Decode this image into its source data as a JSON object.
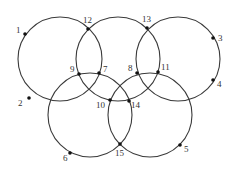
{
  "diagram": {
    "type": "five-interlocking-circles",
    "circles": [
      {
        "id": "top-left",
        "cx": 60,
        "cy": 59,
        "r": 42
      },
      {
        "id": "top-middle",
        "cx": 118,
        "cy": 59,
        "r": 42
      },
      {
        "id": "top-right",
        "cx": 178,
        "cy": 59,
        "r": 42
      },
      {
        "id": "bottom-left",
        "cx": 90,
        "cy": 115,
        "r": 42
      },
      {
        "id": "bottom-right",
        "cx": 150,
        "cy": 115,
        "r": 42
      }
    ],
    "nodes": [
      {
        "label": "1",
        "x": 25,
        "y": 34,
        "lx": 16,
        "ly": 33
      },
      {
        "label": "2",
        "x": 29,
        "y": 98,
        "lx": 18,
        "ly": 106
      },
      {
        "label": "3",
        "x": 213,
        "y": 38,
        "lx": 218,
        "ly": 41
      },
      {
        "label": "4",
        "x": 213,
        "y": 80,
        "lx": 217,
        "ly": 87
      },
      {
        "label": "5",
        "x": 180,
        "y": 145,
        "lx": 184,
        "ly": 152
      },
      {
        "label": "6",
        "x": 70,
        "y": 153,
        "lx": 63,
        "ly": 161
      },
      {
        "label": "7",
        "x": 99,
        "y": 73,
        "lx": 103,
        "ly": 72
      },
      {
        "label": "8",
        "x": 137,
        "y": 73,
        "lx": 128,
        "ly": 71
      },
      {
        "label": "9",
        "x": 79,
        "y": 74,
        "lx": 70,
        "ly": 72
      },
      {
        "label": "10",
        "x": 110,
        "y": 100,
        "lx": 96,
        "ly": 108
      },
      {
        "label": "11",
        "x": 158,
        "y": 72,
        "lx": 161,
        "ly": 70
      },
      {
        "label": "12",
        "x": 88,
        "y": 29,
        "lx": 83,
        "ly": 23
      },
      {
        "label": "13",
        "x": 147,
        "y": 28,
        "lx": 142,
        "ly": 22
      },
      {
        "label": "14",
        "x": 129,
        "y": 101,
        "lx": 131,
        "ly": 108
      },
      {
        "label": "15",
        "x": 120,
        "y": 144,
        "lx": 115,
        "ly": 156
      }
    ]
  }
}
